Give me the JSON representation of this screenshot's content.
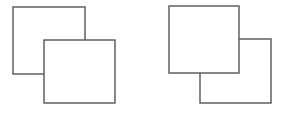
{
  "figure": {
    "canvas": {
      "width": 283,
      "height": 113,
      "background_color": "#ffffff"
    },
    "style": {
      "stroke_color": "#555555",
      "stroke_width": 1.4,
      "fill_color": "#ffffff"
    },
    "groups": [
      {
        "id": "left-pair",
        "label": "Left pair",
        "front_square_id": "left-front-square",
        "stacking_note": "lower-right square drawn in front",
        "squares": [
          {
            "id": "left-back-square",
            "label": "Left pair back square",
            "role": "back",
            "x": 13,
            "y": 7,
            "width": 72,
            "height": 67
          },
          {
            "id": "left-front-square",
            "label": "Left pair front square",
            "role": "front",
            "x": 44,
            "y": 40,
            "width": 71,
            "height": 63
          }
        ]
      },
      {
        "id": "right-pair",
        "label": "Right pair",
        "front_square_id": "right-front-square",
        "stacking_note": "upper-left square drawn in front",
        "squares": [
          {
            "id": "right-back-square",
            "label": "Right pair back square",
            "role": "back",
            "x": 200,
            "y": 39,
            "width": 71,
            "height": 64
          },
          {
            "id": "right-front-square",
            "label": "Right pair front square",
            "role": "front",
            "x": 169,
            "y": 6,
            "width": 70,
            "height": 67
          }
        ]
      }
    ]
  }
}
